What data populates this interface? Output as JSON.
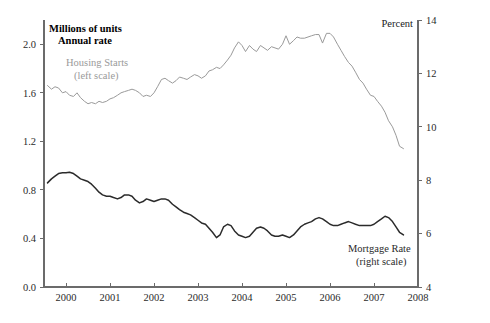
{
  "chart_data": {
    "type": "line",
    "title": "",
    "subtitle": "",
    "left_axis": {
      "label_line1": "Millions of units",
      "label_line2": "Annual rate",
      "ticks": [
        "0.0",
        "0.4",
        "0.8",
        "1.2",
        "1.6",
        "2.0"
      ],
      "tick_values": [
        0.0,
        0.4,
        0.8,
        1.2,
        1.6,
        2.0
      ],
      "ylim": [
        0.0,
        2.2
      ]
    },
    "right_axis": {
      "label": "Percent",
      "ticks": [
        "4",
        "6",
        "8",
        "10",
        "12",
        "14"
      ],
      "tick_values": [
        4,
        6,
        8,
        10,
        12,
        14
      ],
      "ylim": [
        4,
        14
      ]
    },
    "xlabel": "",
    "x_ticks": [
      "2000",
      "2001",
      "2002",
      "2003",
      "2004",
      "2005",
      "2006",
      "2007",
      "2008"
    ],
    "x_tick_values": [
      2000,
      2001,
      2002,
      2003,
      2004,
      2005,
      2006,
      2007,
      2008
    ],
    "xlim": [
      1999.5,
      2008.0
    ],
    "grid": false,
    "legend_position": "inline-annotation",
    "annotations": [
      {
        "name": "housing-starts",
        "line1": "Housing Starts",
        "line2": "(left scale)",
        "color": "#9a9a9a",
        "x": 1999.95,
        "y_left": 1.93
      },
      {
        "name": "mortgage-rate",
        "line1": "Mortgage Rate",
        "line2": "(right scale)",
        "color": "#2b2b2b",
        "x": 2005.75,
        "y_right": 5.55
      }
    ],
    "series": [
      {
        "name": "Housing Starts",
        "axis": "left",
        "unit": "millions of units, annual rate",
        "color": "#9a9a9a",
        "x": [
          1999.58,
          1999.67,
          1999.75,
          1999.83,
          1999.92,
          2000.0,
          2000.08,
          2000.17,
          2000.25,
          2000.33,
          2000.42,
          2000.5,
          2000.58,
          2000.67,
          2000.75,
          2000.83,
          2000.92,
          2001.0,
          2001.08,
          2001.17,
          2001.25,
          2001.33,
          2001.42,
          2001.5,
          2001.58,
          2001.67,
          2001.75,
          2001.83,
          2001.92,
          2002.0,
          2002.08,
          2002.17,
          2002.25,
          2002.33,
          2002.42,
          2002.5,
          2002.58,
          2002.67,
          2002.75,
          2002.83,
          2002.92,
          2003.0,
          2003.08,
          2003.17,
          2003.25,
          2003.33,
          2003.42,
          2003.5,
          2003.58,
          2003.67,
          2003.75,
          2003.83,
          2003.92,
          2004.0,
          2004.08,
          2004.17,
          2004.25,
          2004.33,
          2004.42,
          2004.5,
          2004.58,
          2004.67,
          2004.75,
          2004.83,
          2004.92,
          2005.0,
          2005.08,
          2005.17,
          2005.25,
          2005.33,
          2005.42,
          2005.5,
          2005.58,
          2005.67,
          2005.75,
          2005.83,
          2005.92,
          2006.0,
          2006.08,
          2006.17,
          2006.25,
          2006.33,
          2006.42,
          2006.5,
          2006.58,
          2006.67,
          2006.75,
          2006.83,
          2006.92,
          2007.0,
          2007.08,
          2007.17,
          2007.25,
          2007.33,
          2007.42,
          2007.5,
          2007.58,
          2007.67
        ],
        "values": [
          1.66,
          1.63,
          1.65,
          1.64,
          1.6,
          1.61,
          1.58,
          1.57,
          1.6,
          1.56,
          1.53,
          1.51,
          1.52,
          1.51,
          1.53,
          1.52,
          1.53,
          1.55,
          1.56,
          1.58,
          1.6,
          1.61,
          1.62,
          1.63,
          1.62,
          1.6,
          1.57,
          1.58,
          1.57,
          1.6,
          1.65,
          1.71,
          1.72,
          1.7,
          1.68,
          1.7,
          1.73,
          1.72,
          1.71,
          1.73,
          1.75,
          1.74,
          1.72,
          1.74,
          1.78,
          1.79,
          1.81,
          1.8,
          1.83,
          1.87,
          1.91,
          1.97,
          2.02,
          1.99,
          1.94,
          1.99,
          1.96,
          1.94,
          1.99,
          1.97,
          1.95,
          1.98,
          1.97,
          1.96,
          2.0,
          2.07,
          2.0,
          2.03,
          2.06,
          2.05,
          2.05,
          2.06,
          2.07,
          2.08,
          2.08,
          2.01,
          2.09,
          2.09,
          2.06,
          2.0,
          1.95,
          1.9,
          1.85,
          1.82,
          1.77,
          1.71,
          1.68,
          1.63,
          1.58,
          1.57,
          1.53,
          1.49,
          1.44,
          1.37,
          1.32,
          1.25,
          1.16,
          1.14
        ]
      },
      {
        "name": "Mortgage Rate",
        "axis": "right",
        "unit": "percent",
        "color": "#2b2b2b",
        "x": [
          1999.58,
          1999.67,
          1999.75,
          1999.83,
          1999.92,
          2000.0,
          2000.08,
          2000.17,
          2000.25,
          2000.33,
          2000.42,
          2000.5,
          2000.58,
          2000.67,
          2000.75,
          2000.83,
          2000.92,
          2001.0,
          2001.08,
          2001.17,
          2001.25,
          2001.33,
          2001.42,
          2001.5,
          2001.58,
          2001.67,
          2001.75,
          2001.83,
          2001.92,
          2002.0,
          2002.08,
          2002.17,
          2002.25,
          2002.33,
          2002.42,
          2002.5,
          2002.58,
          2002.67,
          2002.75,
          2002.83,
          2002.92,
          2003.0,
          2003.08,
          2003.17,
          2003.25,
          2003.33,
          2003.42,
          2003.5,
          2003.58,
          2003.67,
          2003.75,
          2003.83,
          2003.92,
          2004.0,
          2004.08,
          2004.17,
          2004.25,
          2004.33,
          2004.42,
          2004.5,
          2004.58,
          2004.67,
          2004.75,
          2004.83,
          2004.92,
          2005.0,
          2005.08,
          2005.17,
          2005.25,
          2005.33,
          2005.42,
          2005.5,
          2005.58,
          2005.67,
          2005.75,
          2005.83,
          2005.92,
          2006.0,
          2006.08,
          2006.17,
          2006.25,
          2006.33,
          2006.42,
          2006.5,
          2006.58,
          2006.67,
          2006.75,
          2006.83,
          2006.92,
          2007.0,
          2007.08,
          2007.17,
          2007.25,
          2007.33,
          2007.42,
          2007.5,
          2007.58,
          2007.67
        ],
        "values": [
          7.9,
          8.05,
          8.15,
          8.25,
          8.28,
          8.28,
          8.3,
          8.25,
          8.15,
          8.05,
          8.0,
          7.95,
          7.85,
          7.7,
          7.55,
          7.45,
          7.4,
          7.4,
          7.35,
          7.3,
          7.35,
          7.45,
          7.45,
          7.4,
          7.25,
          7.15,
          7.2,
          7.3,
          7.25,
          7.2,
          7.25,
          7.3,
          7.3,
          7.25,
          7.1,
          7.0,
          6.9,
          6.8,
          6.75,
          6.7,
          6.6,
          6.5,
          6.4,
          6.35,
          6.2,
          6.05,
          5.85,
          5.95,
          6.25,
          6.35,
          6.3,
          6.1,
          5.95,
          5.9,
          5.85,
          5.9,
          6.05,
          6.2,
          6.25,
          6.2,
          6.1,
          5.95,
          5.9,
          5.9,
          5.95,
          5.9,
          5.85,
          5.95,
          6.1,
          6.25,
          6.35,
          6.4,
          6.45,
          6.55,
          6.6,
          6.55,
          6.45,
          6.35,
          6.3,
          6.3,
          6.35,
          6.4,
          6.45,
          6.4,
          6.35,
          6.3,
          6.3,
          6.3,
          6.3,
          6.35,
          6.45,
          6.55,
          6.65,
          6.6,
          6.45,
          6.25,
          6.05,
          5.95
        ]
      }
    ]
  }
}
